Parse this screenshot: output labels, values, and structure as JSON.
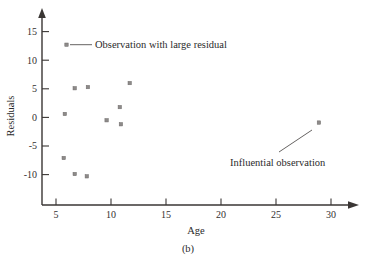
{
  "figure": {
    "caption": "(b)",
    "background_color": "#ffffff",
    "ink_color": "#2b2b2b",
    "point_color": "#8d8a89"
  },
  "chart_data": {
    "type": "scatter",
    "title": "",
    "xlabel": "Age",
    "ylabel": "Residuals",
    "xlim": [
      4.0,
      32.4
    ],
    "ylim": [
      -12.8,
      16.2
    ],
    "xticks": [
      5,
      10,
      15,
      20,
      25,
      30
    ],
    "xtick_labels": [
      "5",
      "10",
      "15",
      "20",
      "25",
      "30"
    ],
    "yticks": [
      -10,
      -5,
      0,
      5,
      10,
      15
    ],
    "ytick_labels": [
      "-10",
      "-5",
      "0",
      "5",
      "10",
      "15"
    ],
    "grid": false,
    "legend_position": "inside-top-left",
    "axis_style": "arrow-ended",
    "series": [
      {
        "name": "Residuals",
        "marker": "small-square",
        "x": [
          5.8,
          6.7,
          7.9,
          5.7,
          6.7,
          7.8,
          9.6,
          10.8,
          10.9,
          11.7,
          28.9
        ],
        "y": [
          0.6,
          5.1,
          5.3,
          -7.1,
          -9.9,
          -10.3,
          -0.5,
          1.8,
          -1.2,
          6.0,
          -0.9
        ]
      }
    ],
    "annotations": [
      {
        "id": "legend-large-residual",
        "label": "Observation with large residual",
        "marker_x": 6.3,
        "marker_y": 12.6,
        "has_leader_line": true
      },
      {
        "id": "influential-observation",
        "label": "Influential observation",
        "target_x": 28.9,
        "target_y": -0.9,
        "has_leader_line": true
      }
    ]
  }
}
